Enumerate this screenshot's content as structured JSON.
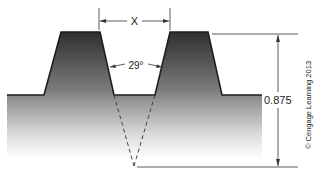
{
  "diagram": {
    "labels": {
      "pitch": "X",
      "angle": "29°",
      "depth": "0.875",
      "credit": "© Cengage Learning 2013"
    },
    "colors": {
      "shade_dark": "#2f2f2f",
      "shade_light": "#ffffff",
      "line": "#222222"
    }
  }
}
